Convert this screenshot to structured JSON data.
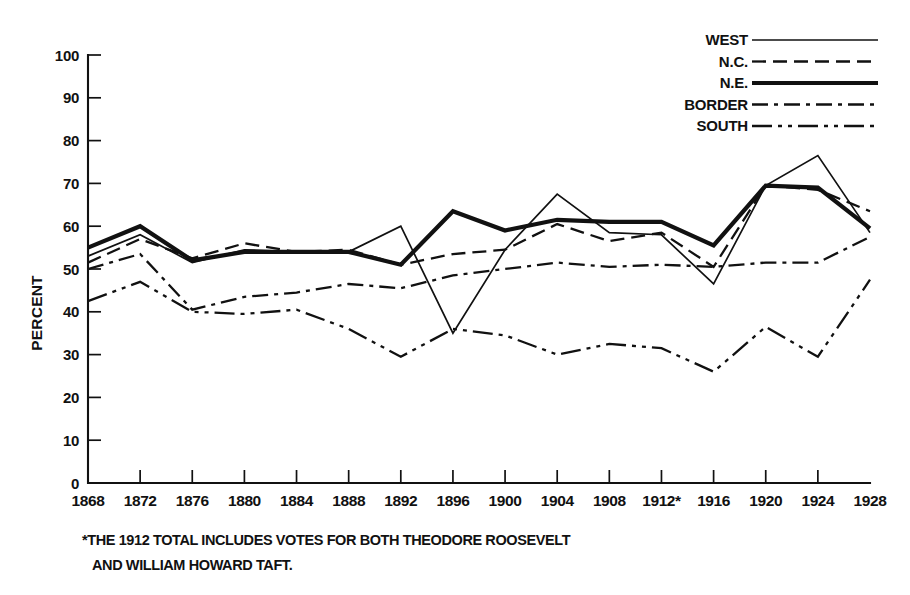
{
  "chart_data": {
    "type": "line",
    "title": "",
    "xlabel": "",
    "ylabel": "PERCENT",
    "ylim": [
      0,
      100
    ],
    "ytick_step": 10,
    "grid": false,
    "legend_position": "top-right",
    "categories": [
      "1868",
      "1872",
      "1876",
      "1880",
      "1884",
      "1888",
      "1892",
      "1896",
      "1900",
      "1904",
      "1908",
      "1912*",
      "1916",
      "1920",
      "1924",
      "1928"
    ],
    "x_tick_labels": [
      "1868",
      "1872",
      "1876",
      "1880",
      "1884",
      "1888",
      "1892",
      "1896",
      "1900",
      "1904",
      "1908",
      "1912*",
      "1916",
      "1920",
      "1924",
      "1928"
    ],
    "y_tick_labels": [
      "0",
      "10",
      "20",
      "30",
      "40",
      "50",
      "60",
      "70",
      "80",
      "90",
      "100"
    ],
    "y_tick_values": [
      0,
      10,
      20,
      30,
      40,
      50,
      60,
      70,
      80,
      90,
      100
    ],
    "series": [
      {
        "name": "WEST",
        "style": "solid-thin",
        "values": [
          53.0,
          58.0,
          51.5,
          54.5,
          54.0,
          54.0,
          60.0,
          35.0,
          54.5,
          67.5,
          58.5,
          58.0,
          46.5,
          69.5,
          76.5,
          58.5
        ]
      },
      {
        "name": "N.C.",
        "style": "dashed",
        "values": [
          51.5,
          57.0,
          52.5,
          56.0,
          54.0,
          54.5,
          51.0,
          53.5,
          54.5,
          60.5,
          56.5,
          58.5,
          50.5,
          69.5,
          68.5,
          63.5
        ]
      },
      {
        "name": "N.E.",
        "style": "solid-thick",
        "values": [
          55.0,
          60.0,
          52.0,
          54.0,
          54.0,
          54.0,
          51.0,
          63.5,
          59.0,
          61.5,
          61.0,
          61.0,
          55.5,
          69.5,
          69.0,
          59.5
        ]
      },
      {
        "name": "BORDER",
        "style": "dash-dot",
        "values": [
          50.0,
          53.5,
          40.5,
          43.5,
          44.5,
          46.5,
          45.5,
          48.5,
          50.0,
          51.5,
          50.5,
          51.0,
          50.5,
          51.5,
          51.5,
          57.5
        ]
      },
      {
        "name": "SOUTH",
        "style": "dash-dot-dot",
        "values": [
          42.5,
          47.0,
          40.0,
          39.5,
          40.5,
          36.0,
          29.5,
          36.0,
          34.5,
          30.0,
          32.5,
          31.5,
          26.0,
          36.5,
          29.5,
          47.5
        ]
      }
    ],
    "annotations": [
      {
        "id": "footnote",
        "line1": "*THE 1912 TOTAL INCLUDES VOTES FOR BOTH THEODORE ROOSEVELT",
        "line2": "AND WILLIAM HOWARD TAFT."
      }
    ]
  },
  "legend": {
    "entries": [
      {
        "label": "WEST",
        "style_key": "lg-west"
      },
      {
        "label": "N.C.",
        "style_key": "lg-nc"
      },
      {
        "label": "N.E.",
        "style_key": "lg-ne"
      },
      {
        "label": "BORDER",
        "style_key": "lg-border"
      },
      {
        "label": "SOUTH",
        "style_key": "lg-south"
      }
    ]
  },
  "axes": {
    "y_title": "PERCENT"
  },
  "footnote": {
    "line1": "*THE 1912 TOTAL INCLUDES VOTES FOR BOTH THEODORE ROOSEVELT",
    "line2": "AND WILLIAM HOWARD TAFT."
  },
  "colors": {
    "ink": "#111111",
    "background": "#ffffff"
  }
}
